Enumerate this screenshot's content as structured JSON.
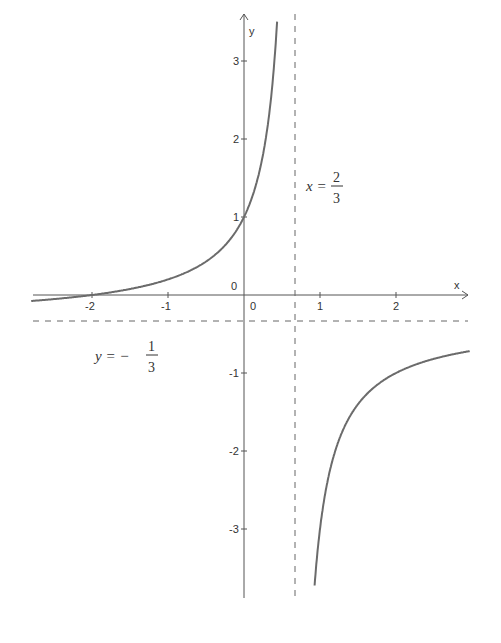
{
  "chart_data": {
    "type": "line",
    "title": "",
    "xlabel": "x",
    "ylabel": "y",
    "xlim": [
      -2.8,
      2.85
    ],
    "ylim": [
      -3.8,
      3.65
    ],
    "x_ticks": [
      "-2",
      "-1",
      "0",
      "1",
      "2"
    ],
    "y_ticks": [
      "3",
      "2",
      "1",
      "0",
      "-1",
      "-2",
      "-3"
    ],
    "function": "y = (x + 2) / (2 - 3x)",
    "series": [
      {
        "name": "f(x) left branch",
        "points": [
          [
            -2.8,
            -0.08
          ],
          [
            -2,
            0
          ],
          [
            -1,
            0.2
          ],
          [
            0,
            1
          ],
          [
            0.3,
            2.09
          ],
          [
            0.4,
            3
          ]
        ]
      },
      {
        "name": "f(x) right branch",
        "points": [
          [
            0.9,
            -3.8
          ],
          [
            1,
            -3
          ],
          [
            1.5,
            -1.4
          ],
          [
            2,
            -1
          ],
          [
            2.97,
            -0.72
          ]
        ]
      }
    ],
    "asymptotes": [
      {
        "type": "vertical",
        "value": 0.6667,
        "label_lhs": "x =",
        "label_num": "2",
        "label_den": "3"
      },
      {
        "type": "horizontal",
        "value": -0.3333,
        "label_lhs": "y = −",
        "label_num": "1",
        "label_den": "3"
      }
    ],
    "grid": false,
    "legend": "none"
  },
  "labels": {
    "x_axis": "x",
    "y_axis": "y",
    "origin_y": "0",
    "origin_x": "0",
    "xticks": [
      {
        "v": -2,
        "t": "-2"
      },
      {
        "v": -1,
        "t": "-1"
      },
      {
        "v": 1,
        "t": "1"
      },
      {
        "v": 2,
        "t": "2"
      }
    ],
    "yticks": [
      {
        "v": 3,
        "t": "3"
      },
      {
        "v": 2,
        "t": "2"
      },
      {
        "v": 1,
        "t": "1"
      },
      {
        "v": -1,
        "t": "-1"
      },
      {
        "v": -2,
        "t": "-2"
      },
      {
        "v": -3,
        "t": "-3"
      }
    ],
    "vasym_lhs": "x =",
    "vasym_num": "2",
    "vasym_den": "3",
    "hasym_lhs": "y = −",
    "hasym_num": "1",
    "hasym_den": "3"
  }
}
